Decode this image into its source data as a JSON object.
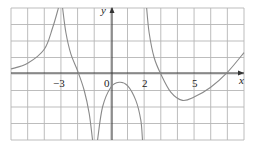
{
  "chart_data": {
    "type": "line",
    "title": "",
    "xlabel": "x",
    "ylabel": "y",
    "xlim": [
      -6,
      8
    ],
    "ylim": [
      -4,
      4
    ],
    "grid": true,
    "grid_step": 1,
    "tick_labels": {
      "x": [
        {
          "value": -3,
          "label": "−3"
        },
        {
          "value": 0,
          "label": "0"
        },
        {
          "value": 2,
          "label": "2"
        },
        {
          "value": 5,
          "label": "5"
        }
      ]
    },
    "vertical_asymptotes": [
      -3,
      -1,
      2
    ],
    "series": [
      {
        "name": "branch-1",
        "points": [
          [
            -6,
            0.3
          ],
          [
            -5,
            0.65
          ],
          [
            -4,
            1.5
          ],
          [
            -3.5,
            2.8
          ],
          [
            -3.15,
            4
          ]
        ]
      },
      {
        "name": "branch-2",
        "points": [
          [
            -2.9,
            4
          ],
          [
            -2.7,
            2.5
          ],
          [
            -2.4,
            1.2
          ],
          [
            -2.0,
            0.2
          ],
          [
            -1.6,
            -1.0
          ],
          [
            -1.3,
            -2.4
          ],
          [
            -1.1,
            -4
          ]
        ]
      },
      {
        "name": "branch-3",
        "points": [
          [
            -0.8,
            -4
          ],
          [
            -0.5,
            -2.0
          ],
          [
            0,
            -0.8
          ],
          [
            0.5,
            -0.5
          ],
          [
            1.0,
            -0.7
          ],
          [
            1.5,
            -1.6
          ],
          [
            1.8,
            -2.8
          ],
          [
            1.9,
            -4
          ]
        ]
      },
      {
        "name": "branch-4",
        "points": [
          [
            2.15,
            4
          ],
          [
            2.3,
            2.5
          ],
          [
            2.6,
            1.0
          ],
          [
            3.0,
            0.0
          ],
          [
            3.6,
            -1.1
          ],
          [
            4.3,
            -1.6
          ],
          [
            5.0,
            -1.4
          ],
          [
            6.0,
            -0.8
          ],
          [
            7.0,
            0.1
          ],
          [
            8.0,
            1.3
          ]
        ]
      }
    ]
  },
  "labels": {
    "x_axis": "x",
    "y_axis": "y",
    "tick_neg3": "−3",
    "tick_0": "0",
    "tick_2": "2",
    "tick_5": "5"
  }
}
